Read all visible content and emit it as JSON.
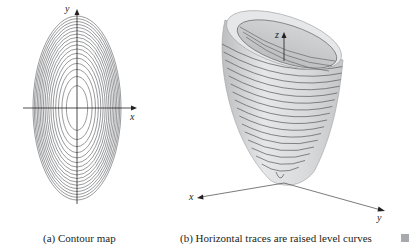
{
  "panels": [
    {
      "id": "a",
      "caption": "(a) Contour map",
      "axes": {
        "x_label": "x",
        "y_label": "y"
      },
      "contour_count": 17,
      "description": "Concentric vertically elongated ellipses centered at the origin"
    },
    {
      "id": "b",
      "caption": "(b) Horizontal traces are raised level curves",
      "axes": {
        "x_label": "x",
        "y_label": "y",
        "z_label": "z"
      },
      "trace_count": 17,
      "description": "Elliptic paraboloid opening upward with horizontal trace curves"
    }
  ],
  "colors": {
    "line": "#231f20",
    "contour": "#6d6e71",
    "surface_light": "#e6e7e8",
    "surface_mid": "#d1d3d4",
    "surface_dark": "#bcbec0",
    "marker": "#a7a9ac"
  }
}
